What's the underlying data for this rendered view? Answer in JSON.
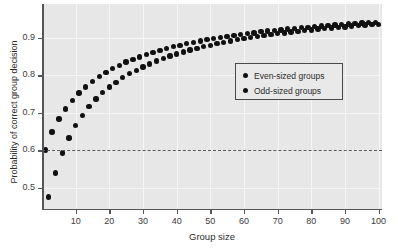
{
  "chart_data": {
    "type": "scatter",
    "title": "",
    "xlabel": "Group size",
    "ylabel": "Probability of correct group decision",
    "xlim": [
      0,
      101
    ],
    "ylim": [
      0.44,
      0.99
    ],
    "xticks": [
      10,
      20,
      30,
      40,
      50,
      60,
      70,
      80,
      90,
      100
    ],
    "yticks": [
      0.5,
      0.6,
      0.7,
      0.8,
      0.9
    ],
    "grid": true,
    "legend_position": "center-right",
    "reference_line": {
      "y": 0.6,
      "style": "dashed",
      "color": "#5a5a5a"
    },
    "series": [
      {
        "name": "Odd-sized groups",
        "marker": "circle",
        "color": "#111111",
        "x": [
          1,
          3,
          5,
          7,
          9,
          11,
          13,
          15,
          17,
          19,
          21,
          23,
          25,
          27,
          29,
          31,
          33,
          35,
          37,
          39,
          41,
          43,
          45,
          47,
          49,
          51,
          53,
          55,
          57,
          59,
          61,
          63,
          65,
          67,
          69,
          71,
          73,
          75,
          77,
          79,
          81,
          83,
          85,
          87,
          89,
          91,
          93,
          95,
          97,
          99
        ],
        "y": [
          0.6,
          0.648,
          0.683,
          0.71,
          0.733,
          0.752,
          0.768,
          0.783,
          0.796,
          0.807,
          0.817,
          0.826,
          0.835,
          0.842,
          0.849,
          0.855,
          0.861,
          0.866,
          0.871,
          0.876,
          0.88,
          0.884,
          0.888,
          0.891,
          0.895,
          0.898,
          0.901,
          0.904,
          0.906,
          0.909,
          0.911,
          0.913,
          0.916,
          0.918,
          0.92,
          0.921,
          0.923,
          0.925,
          0.927,
          0.928,
          0.93,
          0.931,
          0.933,
          0.934,
          0.935,
          0.937,
          0.938,
          0.939,
          0.94,
          0.941
        ]
      },
      {
        "name": "Even-sized groups",
        "marker": "circle",
        "color": "#111111",
        "x": [
          2,
          4,
          6,
          8,
          10,
          12,
          14,
          16,
          18,
          20,
          22,
          24,
          26,
          28,
          30,
          32,
          34,
          36,
          38,
          40,
          42,
          44,
          46,
          48,
          50,
          52,
          54,
          56,
          58,
          60,
          62,
          64,
          66,
          68,
          70,
          72,
          74,
          76,
          78,
          80,
          82,
          84,
          86,
          88,
          90,
          92,
          94,
          96,
          98,
          100
        ],
        "y": [
          0.475,
          0.539,
          0.592,
          0.632,
          0.665,
          0.693,
          0.716,
          0.736,
          0.753,
          0.768,
          0.781,
          0.793,
          0.804,
          0.813,
          0.822,
          0.83,
          0.838,
          0.845,
          0.851,
          0.857,
          0.862,
          0.867,
          0.872,
          0.876,
          0.88,
          0.884,
          0.888,
          0.891,
          0.895,
          0.898,
          0.901,
          0.903,
          0.906,
          0.908,
          0.911,
          0.913,
          0.915,
          0.917,
          0.919,
          0.921,
          0.923,
          0.925,
          0.926,
          0.928,
          0.929,
          0.931,
          0.932,
          0.934,
          0.935,
          0.936
        ]
      }
    ],
    "legend": [
      {
        "label": "Even-sized groups",
        "color": "#111111"
      },
      {
        "label": "Odd-sized groups",
        "color": "#111111"
      }
    ]
  }
}
